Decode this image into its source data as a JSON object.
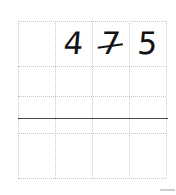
{
  "page": {
    "background_color": "#ffffff",
    "width": 176,
    "height": 195
  },
  "grid": {
    "columns": 4,
    "rows": 4,
    "left": 18,
    "top": 21,
    "right": 166,
    "bottom": 178,
    "column_x": [
      18,
      55,
      92,
      129,
      166
    ],
    "row_y": [
      21,
      66,
      96,
      133,
      178
    ],
    "line_style": "dotted",
    "line_color": "#c9c9c9",
    "line_width_px": 1
  },
  "answer_rule": {
    "label": "sum-line",
    "y": 118,
    "x_start": 18,
    "x_end": 168,
    "color": "#4a4a4a",
    "thickness_px": 1.4,
    "style": "solid"
  },
  "entries": [
    {
      "value": "4",
      "row": 0,
      "column": 1,
      "crossed": false,
      "color": "#121212"
    },
    {
      "value": "7",
      "row": 0,
      "column": 2,
      "crossed": true,
      "color": "#121212"
    },
    {
      "value": "5",
      "row": 0,
      "column": 3,
      "crossed": false,
      "color": "#121212"
    }
  ],
  "artifact": {
    "name": "edge-mark",
    "x": 160,
    "y": 189,
    "width": 15,
    "height": 2,
    "color": "#cfcfcf"
  }
}
